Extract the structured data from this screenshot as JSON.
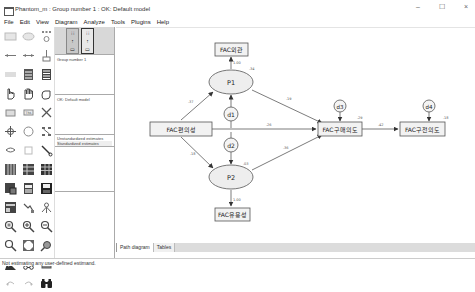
{
  "window": {
    "title": "Phantom_m : Group number 1 : OK: Default model",
    "controls": {
      "minimize": "–",
      "maximize": "☐",
      "close": "×"
    }
  },
  "menu": {
    "items": [
      "File",
      "Edit",
      "View",
      "Diagram",
      "Analyze",
      "Tools",
      "Plugins",
      "Help"
    ]
  },
  "toolbox": {
    "tools": [
      "draw-observed-icon",
      "draw-unobserved-icon",
      "draw-indicator-icon",
      "draw-path-icon",
      "draw-covariance-icon",
      "unique-variable-icon",
      "figure-caption-icon",
      "list-variables-model-icon",
      "list-variables-dataset-icon",
      "select-one-icon",
      "select-all-icon",
      "deselect-all-icon",
      "duplicate-icon",
      "move-icon",
      "erase-icon",
      "change-shape-icon",
      "rotate-indicators-icon",
      "reflect-indicators-icon",
      "move-parameters-icon",
      "scroll-icon",
      "touch-up-icon",
      "select-data-files-icon",
      "analysis-properties-icon",
      "calculate-estimates-icon",
      "view-text-icon",
      "copy-clipboard-icon",
      "save-diagram-icon",
      "object-properties-icon",
      "drag-properties-icon",
      "preserve-symmetries-icon",
      "zoom-area-icon",
      "zoom-in-icon",
      "zoom-out-icon",
      "zoom-page-icon",
      "fit-page-icon",
      "loupe-icon",
      "bayesian-icon",
      "multiple-group-icon",
      "print-icon",
      "undo-icon",
      "redo-icon",
      "specification-search-icon"
    ]
  },
  "panel": {
    "mode_buttons": [
      {
        "label": "input",
        "active": false
      },
      {
        "label": "output",
        "active": true
      }
    ],
    "groups": [
      "Group number 1"
    ],
    "models": [
      "OK: Default model"
    ],
    "estimates": [
      {
        "label": "Unstandardized estimates",
        "selected": false
      },
      {
        "label": "Standardized estimates",
        "selected": true
      }
    ]
  },
  "diagram": {
    "nodes": {
      "fac_external": {
        "label": "FAC외관",
        "type": "observed"
      },
      "fac_convenience": {
        "label": "FAC편의성",
        "type": "observed"
      },
      "fac_purchase": {
        "label": "FAC구매의도",
        "type": "observed"
      },
      "fac_recommend": {
        "label": "FAC구전의도",
        "type": "observed"
      },
      "fac_usefulness": {
        "label": "FAC유용성",
        "type": "observed"
      },
      "p1": {
        "label": "P1",
        "type": "latent"
      },
      "p2": {
        "label": "P2",
        "type": "latent"
      },
      "d1": {
        "label": "d1",
        "type": "error"
      },
      "d2": {
        "label": "d2",
        "type": "error"
      },
      "d3": {
        "label": "d3",
        "type": "error"
      },
      "d4": {
        "label": "d4",
        "type": "error"
      }
    },
    "path_labels": {
      "p1_to_external": "1.00",
      "external_r2": ".34",
      "conv_to_p1": ".37",
      "p1_to_purchase": ".19",
      "conv_to_purchase": ".26",
      "purchase_r2": ".29",
      "purchase_to_recommend": ".42",
      "recommend_r2": ".18",
      "conv_to_p2": ".18",
      "p2_to_purchase": ".36",
      "p2_r2": ".03",
      "p2_to_usefulness": "1.00"
    }
  },
  "tabs": [
    {
      "label": "Path diagram",
      "active": true
    },
    {
      "label": "Tables",
      "active": false
    }
  ],
  "status": {
    "text": "Not estimating any user-defined estimand."
  }
}
